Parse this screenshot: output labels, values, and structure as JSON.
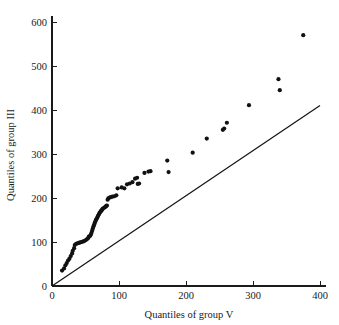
{
  "chart_data": {
    "type": "scatter",
    "title": "",
    "subtitle": "",
    "xlabel": "Quantiles of group V",
    "ylabel": "Quantiles of group III",
    "xlim": [
      0,
      400
    ],
    "ylim": [
      0,
      600
    ],
    "xticks": [
      0,
      100,
      200,
      300,
      400
    ],
    "yticks": [
      0,
      100,
      200,
      300,
      400,
      500,
      600
    ],
    "xtick_labels": [
      "0",
      "100",
      "200",
      "300",
      "400"
    ],
    "ytick_labels": [
      "0",
      "100",
      "200",
      "300",
      "400",
      "500",
      "600"
    ],
    "grid": false,
    "legend": null,
    "legend_position": "none",
    "annotations": [],
    "series": [
      {
        "name": "quantile-pairs",
        "marker": "filled-circle",
        "marker_size": 2.1,
        "color": "#111111",
        "points": [
          [
            15,
            35
          ],
          [
            18,
            40
          ],
          [
            20,
            47
          ],
          [
            22,
            52
          ],
          [
            24,
            58
          ],
          [
            26,
            62
          ],
          [
            28,
            68
          ],
          [
            30,
            74
          ],
          [
            31,
            80
          ],
          [
            33,
            86
          ],
          [
            34,
            93
          ],
          [
            36,
            96
          ],
          [
            38,
            97
          ],
          [
            40,
            98
          ],
          [
            42,
            99
          ],
          [
            44,
            100
          ],
          [
            46,
            101
          ],
          [
            48,
            102
          ],
          [
            50,
            104
          ],
          [
            52,
            106
          ],
          [
            54,
            109
          ],
          [
            55,
            112
          ],
          [
            57,
            114
          ],
          [
            58,
            117
          ],
          [
            59,
            121
          ],
          [
            60,
            126
          ],
          [
            61,
            131
          ],
          [
            62,
            136
          ],
          [
            63,
            140
          ],
          [
            64,
            144
          ],
          [
            65,
            148
          ],
          [
            66,
            151
          ],
          [
            67,
            154
          ],
          [
            68,
            157
          ],
          [
            69,
            160
          ],
          [
            70,
            163
          ],
          [
            71,
            166
          ],
          [
            72,
            168
          ],
          [
            73,
            170
          ],
          [
            74,
            172
          ],
          [
            75,
            174
          ],
          [
            76,
            176
          ],
          [
            78,
            178
          ],
          [
            80,
            180
          ],
          [
            81,
            182
          ],
          [
            82,
            183
          ],
          [
            83,
            196
          ],
          [
            84,
            199
          ],
          [
            86,
            201
          ],
          [
            88,
            202
          ],
          [
            90,
            203
          ],
          [
            93,
            204
          ],
          [
            96,
            206
          ],
          [
            98,
            222
          ],
          [
            104,
            224
          ],
          [
            108,
            222
          ],
          [
            112,
            231
          ],
          [
            116,
            233
          ],
          [
            120,
            236
          ],
          [
            124,
            244
          ],
          [
            127,
            246
          ],
          [
            128,
            232
          ],
          [
            130,
            233
          ],
          [
            138,
            257
          ],
          [
            144,
            260
          ],
          [
            147,
            261
          ],
          [
            172,
            285
          ],
          [
            174,
            259
          ],
          [
            210,
            303
          ],
          [
            231,
            335
          ],
          [
            255,
            355
          ],
          [
            257,
            358
          ],
          [
            261,
            371
          ],
          [
            294,
            411
          ],
          [
            338,
            470
          ],
          [
            340,
            445
          ],
          [
            375,
            570
          ]
        ]
      }
    ],
    "reference_line": {
      "name": "identity-line",
      "type": "line",
      "x": [
        0,
        400
      ],
      "y": [
        0,
        410
      ],
      "color": "#151515"
    }
  }
}
